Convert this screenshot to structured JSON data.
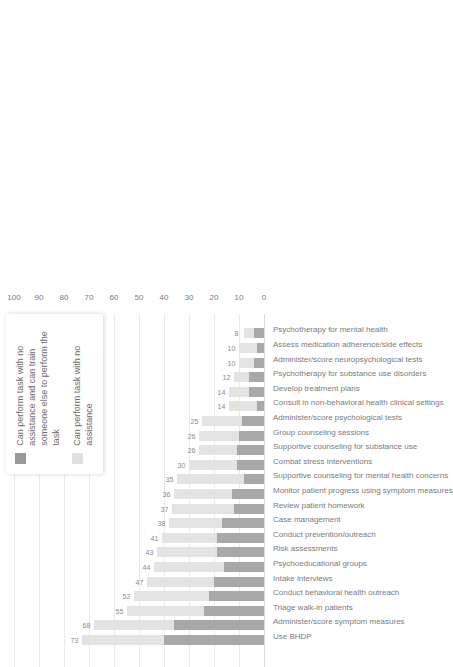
{
  "chart_data": {
    "type": "bar",
    "subtype": "stacked-bar",
    "orientation": "vertical-rotated",
    "title": "",
    "xlabel": "",
    "ylabel": "",
    "ylim": [
      0,
      100
    ],
    "grid": true,
    "legend_position": "top-right",
    "tick_labels": [
      "0",
      "10",
      "20",
      "30",
      "40",
      "50",
      "60",
      "70",
      "80",
      "90",
      "100"
    ],
    "ticks": [
      0,
      10,
      20,
      30,
      40,
      50,
      60,
      70,
      80,
      90,
      100
    ],
    "categories": [
      "Use BHDP",
      "Administer/score symptom measures",
      "Triage walk-in patients",
      "Conduct behavioral health outreach",
      "Intake interviews",
      "Psychoeducational groups",
      "Risk assessments",
      "Conduct prevention/outreach",
      "Case management",
      "Review patient homework",
      "Monitor patient progress using symptom measures",
      "Supportive counseling for mental health concerns",
      "Combat stress interventions",
      "Supportive counseling for substance use",
      "Group counseling sessions",
      "Administer/score psychological tests",
      "Consult in non-behavioral health clinical settings",
      "Develop treatment plans",
      "Psychotherapy for substance use disorders",
      "Administer/score neuropsychological tests",
      "Assess medication adherence/side effects",
      "Psychotherapy for mental health"
    ],
    "totals": [
      73,
      68,
      55,
      52,
      47,
      44,
      43,
      41,
      38,
      37,
      36,
      35,
      30,
      26,
      26,
      25,
      14,
      14,
      12,
      10,
      10,
      8
    ],
    "series": [
      {
        "name": "Can perform task with no assistance and can train someone else to perform the task",
        "color": "#a8a8a8",
        "values": [
          40,
          36,
          24,
          22,
          20,
          16,
          19,
          19,
          17,
          12,
          13,
          8,
          11,
          11,
          10,
          9,
          3,
          6,
          6,
          4,
          3,
          4
        ]
      },
      {
        "name": "Can perform task with no assistance",
        "color": "#e3e3e3",
        "values": [
          33,
          32,
          31,
          30,
          27,
          28,
          24,
          22,
          21,
          25,
          23,
          27,
          19,
          15,
          16,
          16,
          11,
          8,
          6,
          6,
          7,
          4
        ]
      }
    ],
    "legend": [
      {
        "label": "Can perform task with no assistance and can train someone else to perform the task",
        "color": "#9a9a9a"
      },
      {
        "label": "Can perform task with no assistance",
        "color": "#e0e0e0"
      }
    ]
  }
}
